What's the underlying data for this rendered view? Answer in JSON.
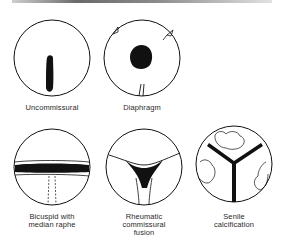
{
  "figures": [
    {
      "id": "uncommissural",
      "label_lines": [
        "Uncommissural"
      ]
    },
    {
      "id": "diaphragm",
      "label_lines": [
        "Diaphragm"
      ]
    },
    {
      "id": "bicuspid",
      "label_lines": [
        "Bicuspid with",
        "median raphe"
      ]
    },
    {
      "id": "rheumatic",
      "label_lines": [
        "Rheumatic",
        "commissural",
        "fusion"
      ]
    },
    {
      "id": "senile",
      "label_lines": [
        "Senile",
        "calcification"
      ]
    }
  ],
  "colors": {
    "ink": "#111111",
    "background": "#ffffff"
  }
}
